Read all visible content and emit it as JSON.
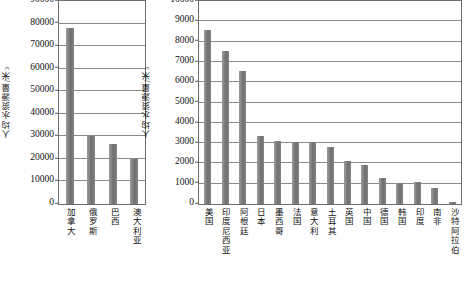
{
  "chart_data": [
    {
      "type": "bar",
      "id": "left-chart",
      "title": "",
      "ylabel": "人均水资源量/米",
      "ylabel_sup": "3",
      "xlabel": "",
      "categories": [
        "加拿大",
        "俄罗斯",
        "巴西",
        "澳大利亚"
      ],
      "values": [
        78000,
        30000,
        26500,
        19800
      ],
      "ylim": [
        0,
        90000
      ],
      "yticks": [
        0,
        10000,
        20000,
        30000,
        40000,
        50000,
        60000,
        70000,
        80000,
        90000
      ],
      "ytick_labels": [
        "0",
        "10000",
        "20000",
        "30000",
        "40000",
        "50000",
        "60000",
        "70000",
        "80000",
        "90000"
      ],
      "grid": true,
      "legend": "none",
      "bar_color": "#7d7d7d"
    },
    {
      "type": "bar",
      "id": "right-chart",
      "title": "",
      "ylabel": "人均水资源量/米",
      "ylabel_sup": "3",
      "xlabel": "",
      "categories": [
        "美国",
        "印度尼西亚",
        "阿根廷",
        "日本",
        "墨西哥",
        "法国",
        "意大利",
        "土耳其",
        "英国",
        "中国",
        "德国",
        "韩国",
        "印度",
        "南非",
        "沙特阿拉伯"
      ],
      "values": [
        8550,
        7550,
        6550,
        3350,
        3120,
        3050,
        3060,
        2800,
        2100,
        1900,
        1280,
        1030,
        1090,
        800,
        80
      ],
      "ylim": [
        0,
        10000
      ],
      "yticks": [
        0,
        1000,
        2000,
        3000,
        4000,
        5000,
        6000,
        7000,
        8000,
        9000,
        10000
      ],
      "ytick_labels": [
        "0",
        "1000",
        "2000",
        "3000",
        "4000",
        "5000",
        "6000",
        "7000",
        "8000",
        "9000",
        "10000"
      ],
      "grid": true,
      "legend": "none",
      "bar_color": "#7d7d7d"
    }
  ]
}
